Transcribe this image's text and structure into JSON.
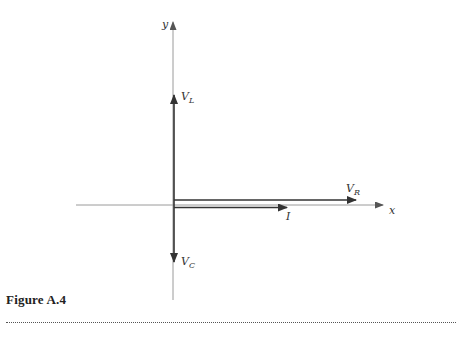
{
  "figure": {
    "caption": "Figure A.4",
    "axes": {
      "x_label": "x",
      "y_label": "y"
    },
    "vectors": [
      {
        "name": "V_L",
        "label_main": "V",
        "label_sub": "L",
        "direction": "up"
      },
      {
        "name": "V_R",
        "label_main": "V",
        "label_sub": "R",
        "direction": "right"
      },
      {
        "name": "I",
        "label_main": "I",
        "label_sub": "",
        "direction": "right"
      },
      {
        "name": "V_C",
        "label_main": "V",
        "label_sub": "C",
        "direction": "down"
      }
    ]
  },
  "colors": {
    "axis": "#9a9a9a",
    "vector": "#333333",
    "text": "#333333",
    "background": "#ffffff"
  }
}
